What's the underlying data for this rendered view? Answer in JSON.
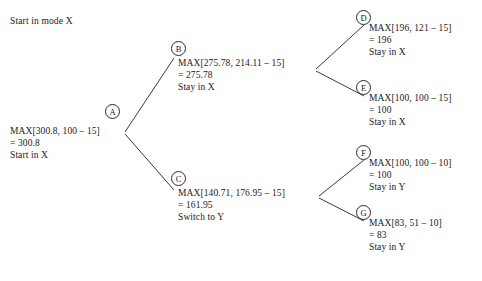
{
  "diagram": {
    "title_note": "Start in mode X",
    "nodes": [
      {
        "id": "A",
        "label": "A",
        "badge_x": 105,
        "badge_y": 104,
        "text_x": 10,
        "text_y": 125,
        "lines": [
          "MAX[300.8, 100 – 15]",
          "= 300.8",
          "Start in X"
        ]
      },
      {
        "id": "B",
        "label": "B",
        "badge_x": 171,
        "badge_y": 41,
        "text_x": 178,
        "text_y": 57,
        "lines": [
          "MAX[275.78, 214.11 – 15]",
          "= 275.78",
          "Stay in X"
        ]
      },
      {
        "id": "C",
        "label": "C",
        "badge_x": 171,
        "badge_y": 171,
        "text_x": 178,
        "text_y": 187,
        "lines": [
          "MAX[140.71, 176.95 – 15]",
          "= 161.95",
          "Switch to Y"
        ]
      },
      {
        "id": "D",
        "label": "D",
        "badge_x": 356,
        "badge_y": 10,
        "text_x": 369,
        "text_y": 22,
        "lines": [
          "MAX[196, 121 – 15]",
          "= 196",
          "Stay in X"
        ]
      },
      {
        "id": "E",
        "label": "E",
        "badge_x": 356,
        "badge_y": 80,
        "text_x": 369,
        "text_y": 92,
        "lines": [
          "MAX[100, 100 – 15]",
          "= 100",
          "Stay in X"
        ]
      },
      {
        "id": "F",
        "label": "F",
        "badge_x": 356,
        "badge_y": 145,
        "text_x": 369,
        "text_y": 157,
        "lines": [
          "MAX[100, 100 – 10]",
          "= 100",
          "Stay in Y"
        ]
      },
      {
        "id": "G",
        "label": "G",
        "badge_x": 356,
        "badge_y": 205,
        "text_x": 369,
        "text_y": 217,
        "lines": [
          "MAX[83, 51 – 10]",
          "= 83",
          "Stay in Y"
        ]
      }
    ],
    "edges": [
      {
        "from": "A",
        "to": "B",
        "x1": 125,
        "y1": 132,
        "x2": 174,
        "y2": 58
      },
      {
        "from": "A",
        "to": "C",
        "x1": 125,
        "y1": 134,
        "x2": 174,
        "y2": 190
      },
      {
        "from": "B",
        "to": "D",
        "x1": 316,
        "y1": 69,
        "x2": 364,
        "y2": 25
      },
      {
        "from": "B",
        "to": "E",
        "x1": 316,
        "y1": 71,
        "x2": 364,
        "y2": 96
      },
      {
        "from": "C",
        "to": "F",
        "x1": 319,
        "y1": 196,
        "x2": 364,
        "y2": 160
      },
      {
        "from": "C",
        "to": "G",
        "x1": 319,
        "y1": 198,
        "x2": 364,
        "y2": 221
      }
    ],
    "line_color": "#3a3a3a"
  }
}
